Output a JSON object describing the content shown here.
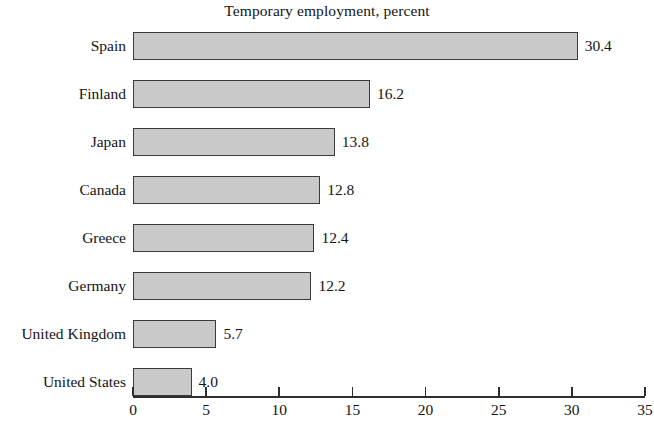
{
  "chart_data": {
    "type": "bar",
    "orientation": "horizontal",
    "title": "Temporary employment, percent",
    "xlabel": "",
    "ylabel": "",
    "categories": [
      "Spain",
      "Finland",
      "Japan",
      "Canada",
      "Greece",
      "Germany",
      "United Kingdom",
      "United States"
    ],
    "values": [
      30.4,
      16.2,
      13.8,
      12.8,
      12.4,
      12.2,
      5.7,
      4.0
    ],
    "value_labels": [
      "30.4",
      "16.2",
      "13.8",
      "12.8",
      "12.4",
      "12.2",
      "5.7",
      "4.0"
    ],
    "xlim": [
      0,
      35
    ],
    "xticks": [
      0,
      5,
      10,
      15,
      20,
      25,
      30,
      35
    ],
    "xtick_labels": [
      "0",
      "5",
      "10",
      "15",
      "20",
      "25",
      "30",
      "35"
    ],
    "grid": false,
    "legend": null,
    "bar_fill_color": "#c9c9c9",
    "bar_border_color": "#3a3a3a",
    "axis_color": "#2e2e2e",
    "background_color": "#ffffff"
  }
}
